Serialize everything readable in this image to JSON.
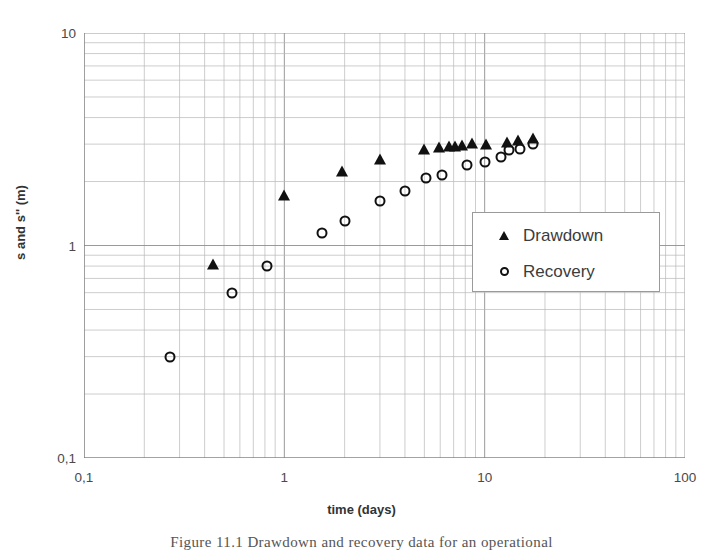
{
  "figure": {
    "caption": "Figure 11.1 Drawdown and recovery data for an operational",
    "background": "#ffffff"
  },
  "chart_data": {
    "type": "scatter",
    "title": "",
    "xlabel": "time (days)",
    "ylabel": "s and s'' (m)",
    "xscale": "log",
    "yscale": "log",
    "xlim": [
      0.1,
      100
    ],
    "ylim": [
      0.1,
      10
    ],
    "grid": true,
    "x_tick_labels": [
      "0,1",
      "1",
      "10",
      "100"
    ],
    "x_tick_values": [
      0.1,
      1,
      10,
      100
    ],
    "y_tick_labels": [
      "0,1",
      "1",
      "10"
    ],
    "y_tick_values": [
      0.1,
      1,
      10
    ],
    "legend_position": "center-right",
    "marker_color": "#111111",
    "grid_color": "#b8b8b8",
    "series": [
      {
        "name": "Drawdown",
        "marker": "triangle-filled",
        "points": [
          [
            0.44,
            0.82
          ],
          [
            1.0,
            1.72
          ],
          [
            1.95,
            2.25
          ],
          [
            3.0,
            2.55
          ],
          [
            5.0,
            2.85
          ],
          [
            5.9,
            2.92
          ],
          [
            6.6,
            2.95
          ],
          [
            7.1,
            2.93
          ],
          [
            7.7,
            2.97
          ],
          [
            8.6,
            3.02
          ],
          [
            10.2,
            3.0
          ],
          [
            13.0,
            3.08
          ],
          [
            14.6,
            3.12
          ],
          [
            17.5,
            3.22
          ]
        ]
      },
      {
        "name": "Recovery",
        "marker": "circle-open",
        "points": [
          [
            0.27,
            0.3
          ],
          [
            0.55,
            0.6
          ],
          [
            0.82,
            0.8
          ],
          [
            1.55,
            1.15
          ],
          [
            2.0,
            1.3
          ],
          [
            3.0,
            1.62
          ],
          [
            4.0,
            1.8
          ],
          [
            5.1,
            2.08
          ],
          [
            6.1,
            2.15
          ],
          [
            8.2,
            2.4
          ],
          [
            10.0,
            2.48
          ],
          [
            12.0,
            2.62
          ],
          [
            13.3,
            2.8
          ],
          [
            15.0,
            2.85
          ],
          [
            17.5,
            3.0
          ]
        ]
      }
    ]
  },
  "legend": {
    "items": [
      {
        "label": "Drawdown",
        "marker": "triangle-filled"
      },
      {
        "label": "Recovery",
        "marker": "circle-open"
      }
    ]
  }
}
